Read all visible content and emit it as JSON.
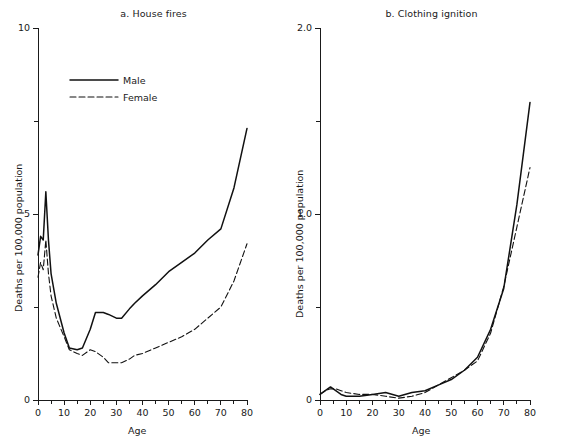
{
  "figure": {
    "shared_xlabel": "Age",
    "shared_ylabel": "Deaths per 100,000 population",
    "legend": {
      "male_label": "Male",
      "female_label": "Female"
    }
  },
  "chart_data": [
    {
      "type": "line",
      "panel": "a",
      "title": "a. House fires",
      "xlabel": "Age",
      "ylabel": "Deaths per 100,000 population",
      "xlim": [
        0,
        80
      ],
      "ylim": [
        0,
        10
      ],
      "xticks": [
        0,
        10,
        20,
        30,
        40,
        50,
        60,
        70,
        80
      ],
      "xtick_labels": [
        "0",
        "10",
        "20",
        "30",
        "40",
        "50",
        "60",
        "70",
        "80"
      ],
      "xminor_ticks": [
        5,
        15,
        25,
        35,
        45,
        55,
        65,
        75
      ],
      "yticks": [
        0,
        5,
        10
      ],
      "ytick_labels": [
        "0",
        "5",
        "10"
      ],
      "yminor_ticks": [
        2.5,
        7.5
      ],
      "grid": false,
      "legend_position": "upper-left",
      "x": [
        0,
        1,
        2,
        3,
        4,
        5,
        7,
        10,
        12,
        15,
        17,
        20,
        22,
        25,
        27,
        30,
        32,
        35,
        37,
        40,
        45,
        50,
        55,
        60,
        65,
        70,
        75,
        80
      ],
      "series": [
        {
          "name": "Male",
          "style": "solid",
          "values": [
            3.9,
            4.4,
            4.3,
            5.6,
            4.3,
            3.4,
            2.6,
            1.8,
            1.4,
            1.35,
            1.4,
            1.9,
            2.35,
            2.35,
            2.3,
            2.2,
            2.2,
            2.45,
            2.6,
            2.8,
            3.1,
            3.45,
            3.7,
            3.95,
            4.3,
            4.6,
            5.7,
            7.3
          ]
        },
        {
          "name": "Female",
          "style": "dashed",
          "values": [
            3.3,
            3.7,
            3.5,
            4.3,
            3.4,
            2.8,
            2.2,
            1.7,
            1.35,
            1.25,
            1.2,
            1.35,
            1.3,
            1.15,
            1.0,
            1.0,
            1.0,
            1.1,
            1.2,
            1.25,
            1.4,
            1.55,
            1.7,
            1.9,
            2.2,
            2.5,
            3.2,
            4.2
          ]
        }
      ]
    },
    {
      "type": "line",
      "panel": "b",
      "title": "b. Clothing ignition",
      "xlabel": "Age",
      "ylabel": "Deaths per 100,000 population",
      "xlim": [
        0,
        80
      ],
      "ylim": [
        0,
        2.0
      ],
      "xticks": [
        0,
        10,
        20,
        30,
        40,
        50,
        60,
        70,
        80
      ],
      "xtick_labels": [
        "0",
        "10",
        "20",
        "30",
        "40",
        "50",
        "60",
        "70",
        "80"
      ],
      "xminor_ticks": [
        5,
        15,
        25,
        35,
        45,
        55,
        65,
        75
      ],
      "yticks": [
        0,
        1.0,
        2.0
      ],
      "ytick_labels": [
        "0",
        "1.0",
        "2.0"
      ],
      "yminor_ticks": [
        0.5,
        1.5
      ],
      "grid": false,
      "legend_position": "none",
      "x": [
        0,
        2,
        4,
        6,
        8,
        10,
        15,
        20,
        25,
        30,
        35,
        40,
        45,
        50,
        55,
        60,
        65,
        70,
        75,
        80
      ],
      "series": [
        {
          "name": "Male",
          "style": "solid",
          "values": [
            0.03,
            0.05,
            0.07,
            0.05,
            0.03,
            0.02,
            0.02,
            0.03,
            0.04,
            0.02,
            0.04,
            0.05,
            0.08,
            0.11,
            0.16,
            0.23,
            0.38,
            0.6,
            1.05,
            1.6
          ]
        },
        {
          "name": "Female",
          "style": "dashed",
          "values": [
            0.03,
            0.05,
            0.06,
            0.06,
            0.05,
            0.04,
            0.03,
            0.03,
            0.02,
            0.01,
            0.02,
            0.04,
            0.08,
            0.12,
            0.16,
            0.21,
            0.36,
            0.61,
            0.93,
            1.25
          ]
        }
      ]
    }
  ]
}
